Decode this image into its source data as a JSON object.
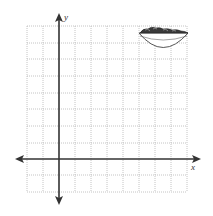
{
  "figure": {
    "type": "coordinate-grid",
    "grid": {
      "columns": 10,
      "rows": 10,
      "left": 27,
      "top": 26,
      "cell": 16.1,
      "line_color": "#b8b8b8",
      "style": "dotted"
    },
    "axes": {
      "x_label": "x",
      "y_label": "y",
      "origin_col": 2,
      "origin_row": 8,
      "color": "#333333"
    },
    "image": {
      "semantic": "salad-bowl-icon",
      "position": "top-right of grid"
    }
  }
}
